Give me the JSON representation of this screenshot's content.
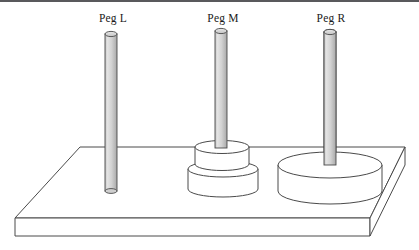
{
  "figure": {
    "background_color": "#ffffff",
    "line_color": "#3c3c3c",
    "shade_color": "#d9d9d9",
    "fill_color": "#ffffff",
    "rule_color": "#59595c"
  },
  "pegs": [
    {
      "id": "peg-l",
      "label": "Peg L",
      "label_x": 113,
      "label_y": 22,
      "cx": 111,
      "top_y": 34,
      "bottom_y": 191,
      "half_width": 6,
      "disk_count": 0,
      "disks": []
    },
    {
      "id": "peg-m",
      "label": "Peg M",
      "label_x": 223,
      "label_y": 22,
      "cx": 221,
      "top_y": 31,
      "bottom_y": 163,
      "half_width": 6,
      "disk_count": 2,
      "disks": [
        {
          "id": "disk-m-small",
          "size": "small",
          "rx": 27,
          "ry": 6.5,
          "cx": 222,
          "top_cy": 147,
          "thickness": 17
        },
        {
          "id": "disk-m-medium",
          "size": "medium",
          "rx": 35,
          "ry": 8,
          "cx": 223,
          "top_cy": 169,
          "thickness": 20
        }
      ]
    },
    {
      "id": "peg-r",
      "label": "Peg R",
      "label_x": 331,
      "label_y": 22,
      "cx": 330,
      "top_y": 32,
      "bottom_y": 180,
      "half_width": 6,
      "disk_count": 1,
      "disks": [
        {
          "id": "disk-r-large",
          "size": "large",
          "rx": 52,
          "ry": 13,
          "cx": 330,
          "top_cy": 165,
          "thickness": 26
        }
      ]
    }
  ],
  "base": {
    "id": "board-base",
    "top_face": "80,147 405,147 370,218 15,218",
    "front_face": "15,218 370,218 370,236 15,236",
    "right_face": "370,218 405,147 405,165 370,236",
    "thickness": 18
  },
  "stats": {
    "total_pegs": 3,
    "total_disks": 3
  }
}
